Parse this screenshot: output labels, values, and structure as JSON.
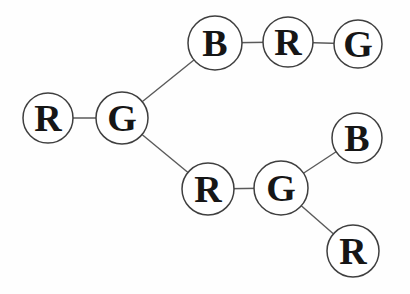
{
  "diagram": {
    "background_color": "#fefefe",
    "node_fill_color": "#ffffff",
    "node_stroke_color": "#3f3f3f",
    "edge_color": "#5a5a5a",
    "label_color": "#161616",
    "nodes": [
      {
        "id": "n1",
        "label": "B",
        "x": 215,
        "y": 43,
        "r": 27
      },
      {
        "id": "n2",
        "label": "R",
        "x": 288,
        "y": 42,
        "r": 25
      },
      {
        "id": "n3",
        "label": "G",
        "x": 358,
        "y": 44,
        "r": 24
      },
      {
        "id": "n4",
        "label": "R",
        "x": 48,
        "y": 118,
        "r": 25
      },
      {
        "id": "n5",
        "label": "G",
        "x": 122,
        "y": 118,
        "r": 26
      },
      {
        "id": "n6",
        "label": "R",
        "x": 208,
        "y": 189,
        "r": 26
      },
      {
        "id": "n7",
        "label": "G",
        "x": 281,
        "y": 188,
        "r": 27
      },
      {
        "id": "n8",
        "label": "B",
        "x": 357,
        "y": 138,
        "r": 25
      },
      {
        "id": "n9",
        "label": "R",
        "x": 353,
        "y": 251,
        "r": 26
      }
    ],
    "edges": [
      {
        "from": "n1",
        "to": "n2"
      },
      {
        "from": "n2",
        "to": "n3"
      },
      {
        "from": "n4",
        "to": "n5"
      },
      {
        "from": "n5",
        "to": "n1"
      },
      {
        "from": "n5",
        "to": "n6"
      },
      {
        "from": "n6",
        "to": "n7"
      },
      {
        "from": "n7",
        "to": "n8"
      },
      {
        "from": "n7",
        "to": "n9"
      }
    ]
  }
}
